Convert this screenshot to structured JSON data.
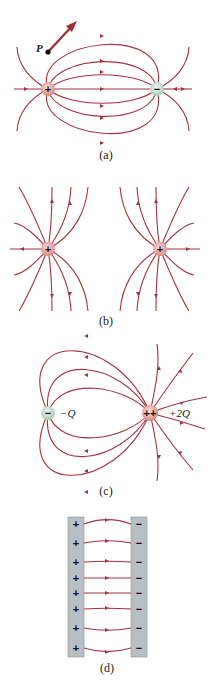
{
  "figure": {
    "panels": [
      {
        "id": "a",
        "caption": "(a)",
        "description": "Electric dipole field lines between equal positive and negative charges",
        "charges": [
          {
            "sign": "+",
            "symbol": "+",
            "x": 48,
            "y": 89,
            "color": "#e8a7a3"
          },
          {
            "sign": "-",
            "symbol": "−",
            "x": 157,
            "y": 89,
            "color": "#c7dcd2"
          }
        ],
        "point": {
          "label": "P",
          "x": 48,
          "y": 52
        },
        "field_vector": {
          "from": [
            48,
            52
          ],
          "to": [
            76,
            22
          ]
        }
      },
      {
        "id": "b",
        "caption": "(b)",
        "description": "Field lines of two equal positive charges",
        "charges": [
          {
            "sign": "+",
            "symbol": "+",
            "x": 48,
            "y": 249,
            "color": "#e8a7a3"
          },
          {
            "sign": "+",
            "symbol": "+",
            "x": 160,
            "y": 249,
            "color": "#e8a7a3"
          }
        ]
      },
      {
        "id": "c",
        "caption": "(c)",
        "description": "Field lines of charges -Q and +2Q",
        "charges": [
          {
            "sign": "-",
            "symbol": "−",
            "label": "−Q",
            "x": 48,
            "y": 413,
            "color": "#c7dcd2"
          },
          {
            "sign": "+",
            "symbol": "++",
            "label": "+2Q",
            "x": 150,
            "y": 413,
            "color": "#e8a7a3"
          }
        ]
      },
      {
        "id": "d",
        "caption": "(d)",
        "description": "Uniform field between oppositely charged parallel plates",
        "plates": [
          {
            "side": "left",
            "sign": "+",
            "symbols": [
              "+",
              "+",
              "+",
              "+",
              "+",
              "+",
              "+",
              "+"
            ]
          },
          {
            "side": "right",
            "sign": "-",
            "symbols": [
              "−",
              "−",
              "−",
              "−",
              "−",
              "−",
              "−",
              "−"
            ]
          }
        ]
      }
    ],
    "colors": {
      "field_line": "#a8323e",
      "positive_charge": "#e8a7a3",
      "negative_charge": "#c7dcd2",
      "plate": "#b7bec4"
    }
  }
}
